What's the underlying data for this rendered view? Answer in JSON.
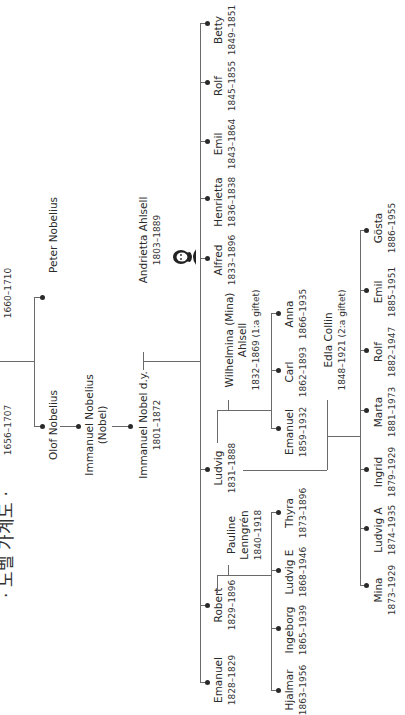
{
  "title": "· 노벨 가계도 ·",
  "colors": {
    "line": "#6a6a6a",
    "text": "#2a2a2a",
    "background": "#ffffff"
  },
  "ancestors": {
    "gen0_left_years": "1656–1707",
    "gen0_right_years": "1660–1710"
  },
  "people": {
    "peter_nobelius": {
      "name": "Peter Nobelius"
    },
    "olof_nobelius": {
      "name": "Olof Nobelius"
    },
    "immanuel_nobelius": {
      "name": "Immanuel Nobelius",
      "alias": "(Nobel)"
    },
    "immanuel_nobel": {
      "name": "Immanuel Nobel d.y.",
      "years": "1801–1872"
    },
    "andrietta": {
      "name": "Andrietta Ahlsell",
      "years": "1803–1889"
    },
    "betty": {
      "name": "Betty",
      "years": "1849–1851"
    },
    "rolf": {
      "name": "Rolf",
      "years": "1845–1855"
    },
    "emil": {
      "name": "Emil",
      "years": "1843–1864"
    },
    "henrietta": {
      "name": "Henrietta",
      "years": "1836–1838"
    },
    "alfred": {
      "name": "Alfred",
      "years": "1833–1896"
    },
    "ludvig": {
      "name": "Ludvig",
      "years": "1831–1888"
    },
    "robert": {
      "name": "Robert",
      "years": "1829–1896"
    },
    "emanuel_sr": {
      "name": "Emanuel",
      "years": "1828–1829"
    },
    "wilhelmina": {
      "name": "Wilhelmina (Mina)",
      "name2": "Ahlsell",
      "years": "1832–1869 (1:a giftet)"
    },
    "edla": {
      "name": "Edla Collin",
      "years": "1848–1921 (2:a giftet)"
    },
    "pauline": {
      "name": "Pauline",
      "name2": "Lenngrén",
      "years": "1840–1918"
    },
    "anna": {
      "name": "Anna",
      "years": "1866–1935"
    },
    "carl": {
      "name": "Carl",
      "years": "1862–1893"
    },
    "emanuel_l": {
      "name": "Emanuel",
      "years": "1859–1932"
    },
    "gosta": {
      "name": "Gösta",
      "years": "1886–1955"
    },
    "emil_l": {
      "name": "Emil",
      "years": "1885–1951"
    },
    "rolf_l": {
      "name": "Rolf",
      "years": "1882–1947"
    },
    "marta": {
      "name": "Marta",
      "years": "1881–1973"
    },
    "ingrid": {
      "name": "Ingrid",
      "years": "1879–1929"
    },
    "ludvig_a": {
      "name": "Ludvig A",
      "years": "1874–1935"
    },
    "mina": {
      "name": "Mina",
      "years": "1873–1929"
    },
    "thyra": {
      "name": "Thyra",
      "years": "1873–1896"
    },
    "ludvig_e": {
      "name": "Ludvig E",
      "years": "1868–1946"
    },
    "ingeborg": {
      "name": "Ingeborg",
      "years": "1865–1939"
    },
    "hjalmar": {
      "name": "Hjalmar",
      "years": "1863–1956"
    }
  },
  "icons": {
    "portrait": "alfred-nobel-portrait-icon"
  }
}
